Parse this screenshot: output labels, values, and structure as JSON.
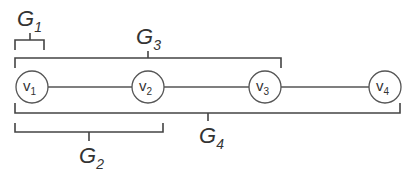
{
  "diagram": {
    "type": "path-graph-with-group-brackets",
    "nodes": [
      {
        "id": "v1",
        "base": "v",
        "sub": "1",
        "cx": 32,
        "cy": 87
      },
      {
        "id": "v2",
        "base": "v",
        "sub": "2",
        "cx": 148,
        "cy": 87
      },
      {
        "id": "v3",
        "base": "v",
        "sub": "3",
        "cx": 265,
        "cy": 87
      },
      {
        "id": "v4",
        "base": "v",
        "sub": "4",
        "cx": 385,
        "cy": 87
      }
    ],
    "edges": [
      [
        "v1",
        "v2"
      ],
      [
        "v2",
        "v3"
      ],
      [
        "v3",
        "v4"
      ]
    ],
    "groups": [
      {
        "id": "G1",
        "base": "G",
        "sub": "1",
        "members": [
          "v1"
        ],
        "position": "above"
      },
      {
        "id": "G2",
        "base": "G",
        "sub": "2",
        "members": [
          "v1",
          "v2"
        ],
        "position": "below"
      },
      {
        "id": "G3",
        "base": "G",
        "sub": "3",
        "members": [
          "v1",
          "v2",
          "v3"
        ],
        "position": "above"
      },
      {
        "id": "G4",
        "base": "G",
        "sub": "4",
        "members": [
          "v1",
          "v2",
          "v3",
          "v4"
        ],
        "position": "below"
      }
    ],
    "colors": {
      "stroke": "#444444",
      "text": "#333333",
      "background": "#ffffff"
    }
  }
}
